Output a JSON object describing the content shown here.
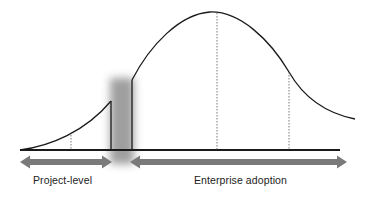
{
  "diagram": {
    "type": "adoption-curve",
    "phases": [
      {
        "id": "project-level",
        "label": "Project-level",
        "arrow": "double-headed",
        "span_px": [
          20,
          112
        ]
      },
      {
        "id": "enterprise-adoption",
        "label": "Enterprise adoption",
        "arrow": "double-headed",
        "span_px": [
          130,
          347
        ]
      }
    ],
    "gap": {
      "description": "shaded transition gap between phases",
      "color": "#9a9a9a"
    },
    "markers": [
      {
        "kind": "dotted-vertical",
        "phase": "project-level",
        "x_px": 71
      },
      {
        "kind": "dotted-vertical",
        "phase": "enterprise-adoption",
        "x_px": 217,
        "note": "curve peak"
      },
      {
        "kind": "dotted-vertical",
        "phase": "enterprise-adoption",
        "x_px": 289,
        "note": "inflection"
      }
    ],
    "colors": {
      "curve": "#1a1a1a",
      "baseline": "#1a1a1a",
      "arrow": "#7a7a7a",
      "gap_shade": "#9a9a9a",
      "text": "#222222"
    }
  }
}
